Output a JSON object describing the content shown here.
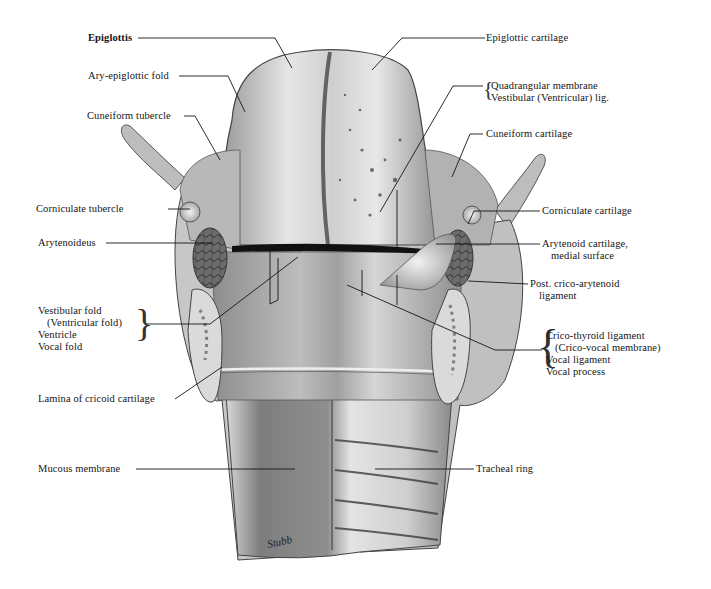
{
  "figure": {
    "signature": "Stubb",
    "colors": {
      "background": "#ffffff",
      "ink": "#151515",
      "tissue_light": "#e2e2e2",
      "tissue_mid": "#a9a9a9",
      "tissue_dark": "#555555"
    }
  },
  "labels": {
    "left": {
      "epiglottis": "Epiglottis",
      "ary_epiglottic_fold": "Ary-epiglottic fold",
      "cuneiform_tubercle": "Cuneiform tubercle",
      "corniculate_tubercle": "Corniculate tubercle",
      "arytenoideus": "Arytenoideus",
      "vestibular_group": [
        "Vestibular fold",
        "(Ventricular fold)",
        "Ventricle",
        "Vocal fold"
      ],
      "lamina_cricoid": "Lamina of cricoid cartilage",
      "mucous_membrane": "Mucous membrane"
    },
    "right": {
      "epiglottic_cartilage": "Epiglottic cartilage",
      "quadrangular_group": [
        "Quadrangular membrane",
        "Vestibular (Ventricular) lig."
      ],
      "cuneiform_cartilage": "Cuneiform cartilage",
      "corniculate_cartilage": "Corniculate cartilage",
      "arytenoid_cartilage": [
        "Arytenoid cartilage,",
        "medial surface"
      ],
      "post_crico_arytenoid": [
        "Post. crico-arytenoid",
        "ligament"
      ],
      "crico_thyroid_group": [
        "Crico-thyroid ligament",
        "(Crico-vocal membrane)",
        "Vocal ligament",
        "Vocal process"
      ],
      "tracheal_ring": "Tracheal ring"
    }
  }
}
